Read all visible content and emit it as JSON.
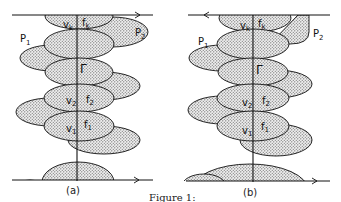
{
  "figure": {
    "caption": "Figure 1:",
    "panels": [
      {
        "id": "a",
        "label": "(a)",
        "top_arrow_direction": "right",
        "bottom_arrow_direction": "right",
        "labels": {
          "vk": "v",
          "vk_sub": "k",
          "fk": "f",
          "fk_sub": "k",
          "P1": "P",
          "P1_sub": "1",
          "P2": "P",
          "P2_sub": "2",
          "Gamma": "Γ",
          "v2": "v",
          "v2_sub": "2",
          "f2": "f",
          "f2_sub": "2",
          "v1": "v",
          "v1_sub": "1",
          "f1": "f",
          "f1_sub": "1"
        }
      },
      {
        "id": "b",
        "label": "(b)",
        "top_arrow_direction": "left",
        "bottom_arrow_direction": "right",
        "labels": {
          "vk": "v",
          "vk_sub": "k",
          "fk": "f",
          "fk_sub": "k",
          "P1": "P",
          "P1_sub": "1",
          "P2": "P",
          "P2_sub": "2",
          "Gamma": "Γ",
          "v2": "v",
          "v2_sub": "2",
          "f2": "f",
          "f2_sub": "2",
          "v1": "v",
          "v1_sub": "1",
          "f1": "f",
          "f1_sub": "1"
        }
      }
    ]
  },
  "colors": {
    "stroke": "#111111",
    "fill_dots": "#b8b8b8",
    "background": "#ffffff"
  }
}
